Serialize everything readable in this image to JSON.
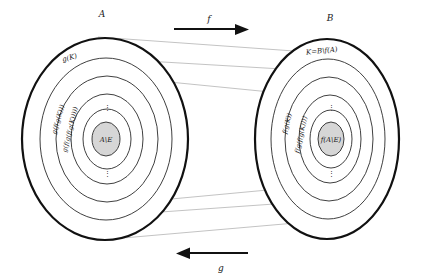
{
  "figure": {
    "background_color": "#ffffff",
    "outline_color": "#111111",
    "ring_color": "#2a2a2a",
    "shade_color": "#d6d6d6",
    "map_line_color": "#9a9a9a"
  },
  "left_set": {
    "name": "A",
    "top_ring_label": "g(K)",
    "rings": [
      {
        "label": "g(K)",
        "rotated": false
      },
      {
        "label": "g(f(g(K)))",
        "rotated": true
      },
      {
        "label": "g(f(g(f(g(K)))))",
        "rotated": true
      }
    ],
    "core_label": "A\\E",
    "vertical_dots": "⋮"
  },
  "right_set": {
    "name": "B",
    "top_ring_label": "K=B\\f(A)",
    "rings": [
      {
        "label": "K=B\\f(A)",
        "rotated": false
      },
      {
        "label": "f(g(K))",
        "rotated": true
      },
      {
        "label": "f(g(f(g(K))))",
        "rotated": true
      }
    ],
    "core_label": "f(A\\E)",
    "vertical_dots": "⋮"
  },
  "arrows": {
    "top": {
      "label": "f",
      "direction": "right"
    },
    "bottom": {
      "label": "g",
      "direction": "left"
    }
  }
}
